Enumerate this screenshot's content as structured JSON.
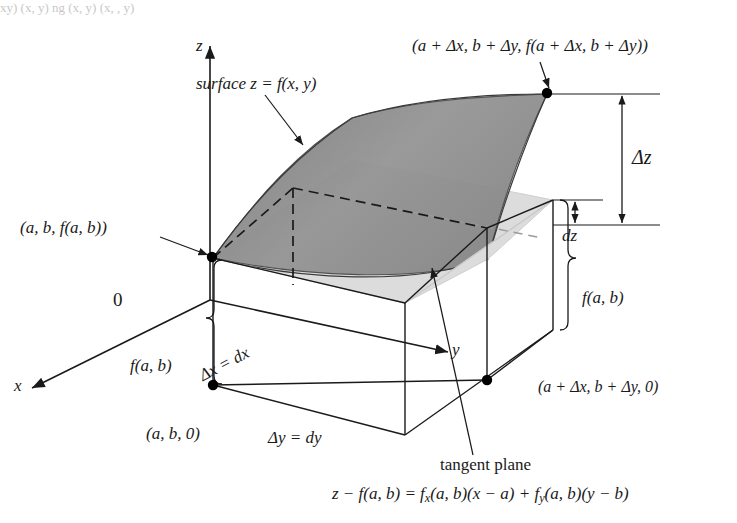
{
  "figure": {
    "type": "math-diagram",
    "background": "#ffffff"
  },
  "colors": {
    "surface_fill": "#8c8c8c",
    "plane_fill": "#d8d8d8",
    "line": "#1a1a1a",
    "dot": "#000000",
    "box_fill": "#ffffff",
    "text": "#1a1a1a"
  },
  "axes": {
    "z_label": "z",
    "x_label": "x",
    "y_label": "y",
    "origin_label": "0"
  },
  "labels": {
    "surface": "surface z = f(x, y)",
    "point_far": "(a + Δx, b + Δy, f(a + Δx, b + Δy))",
    "point_near": "(a, b, f(a, b))",
    "point_base": "(a, b, 0)",
    "point_base_far": "(a + Δx, b + Δy, 0)",
    "delta_z": "Δz",
    "dz": "dz",
    "f_ab_left": "f(a, b)",
    "f_ab_right": "f(a, b)",
    "delta_x": "Δx = dx",
    "delta_y": "Δy = dy",
    "tangent_plane": "tangent plane",
    "tangent_equation": "z − f(a, b) = fₓ(a, b)(x − a) + fᵧ(a, b)(y − b)"
  },
  "equation_parts": {
    "lhs": "z − f(a, b) =",
    "term1_fn": "f",
    "term1_sub": "x",
    "term1_rest": "(a, b)(x − a)",
    "plus": "+",
    "term2_fn": "f",
    "term2_sub": "y",
    "term2_rest": "(a, b)(y − b)"
  },
  "top_fragment": "xy)       (x, y)       ng         (x, y)    (x,      ,   y)"
}
